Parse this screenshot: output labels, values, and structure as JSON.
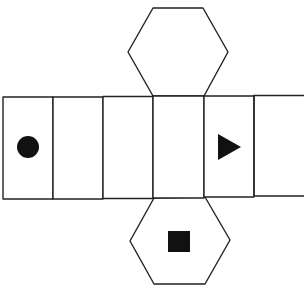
{
  "diagram": {
    "type": "hexagonal-prism-net",
    "faces": {
      "top_hexagon": {
        "symbol": "none"
      },
      "bottom_hexagon": {
        "symbol": "square"
      },
      "rectangles": [
        {
          "index": 1,
          "symbol": "circle"
        },
        {
          "index": 2,
          "symbol": "none"
        },
        {
          "index": 3,
          "symbol": "none"
        },
        {
          "index": 4,
          "symbol": "none"
        },
        {
          "index": 5,
          "symbol": "triangle"
        },
        {
          "index": 6,
          "symbol": "none"
        }
      ]
    },
    "colors": {
      "stroke": "#222222",
      "fill": "#ffffff",
      "symbol": "#111111"
    }
  }
}
